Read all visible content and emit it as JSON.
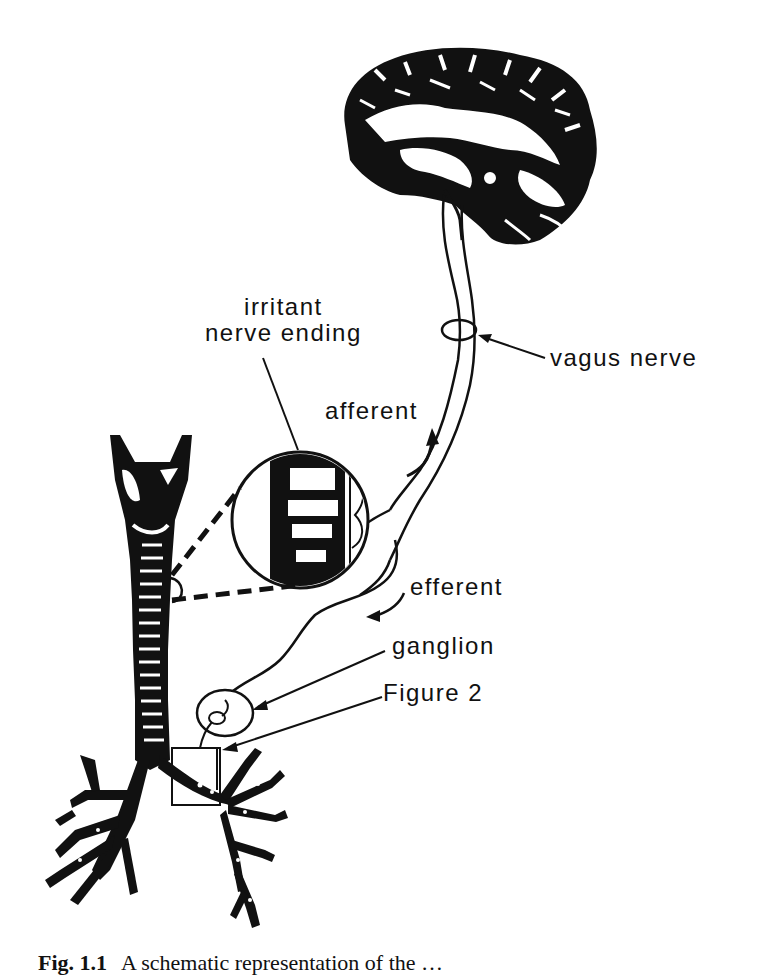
{
  "figure": {
    "labels": {
      "irritant_line1": "irritant",
      "irritant_line2": "nerve ending",
      "vagus": "vagus nerve",
      "afferent": "afferent",
      "efferent": "efferent",
      "ganglion": "ganglion",
      "figure2": "Figure 2"
    },
    "parts": [
      "brain",
      "vagus nerve",
      "trachea",
      "bronchial tree",
      "magnified airway wall",
      "ganglion",
      "Figure 2 inset box"
    ],
    "colors": {
      "ink": "#111111",
      "background": "#ffffff"
    }
  },
  "caption": {
    "number": "Fig. 1.1",
    "text": "A schematic representation of the …"
  }
}
